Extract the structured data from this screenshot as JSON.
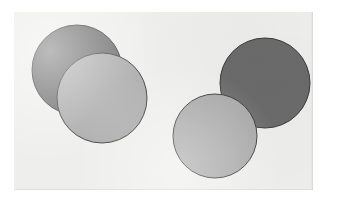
{
  "figure": {
    "canvas": {
      "width": 339,
      "height": 203
    },
    "panel": {
      "x": 14,
      "y": 12,
      "width": 299,
      "height": 178,
      "background_color": "#eeeeec"
    },
    "page_background_color": "#ffffff",
    "palette": {
      "dark_gray_fill": "#6b6b6b",
      "light_gray_fill": "#a9a9a9",
      "outline_color": "#3a3a3a",
      "panel_background": "#eeeeec",
      "page_background": "#ffffff"
    },
    "stroke_width": 1,
    "shapes": [
      {
        "id": "circle-1",
        "label": "left dark circle",
        "shade": "dark",
        "fill": "#6b6b6b",
        "stroke": "#3a3a3a",
        "cx": 63,
        "cy": 58,
        "r": 45,
        "z": 1
      },
      {
        "id": "circle-2",
        "label": "left light circle",
        "shade": "light",
        "fill": "#a9a9a9",
        "stroke": "#3a3a3a",
        "cx": 88,
        "cy": 86,
        "r": 45,
        "z": 2
      },
      {
        "id": "circle-3",
        "label": "right dark circle",
        "shade": "dark",
        "fill": "#6b6b6b",
        "stroke": "#3a3a3a",
        "cx": 251,
        "cy": 71,
        "r": 45,
        "z": 1
      },
      {
        "id": "circle-4",
        "label": "right light circle",
        "shade": "light",
        "fill": "#a9a9a9",
        "stroke": "#3a3a3a",
        "cx": 201,
        "cy": 124,
        "r": 42,
        "z": 2
      }
    ]
  }
}
